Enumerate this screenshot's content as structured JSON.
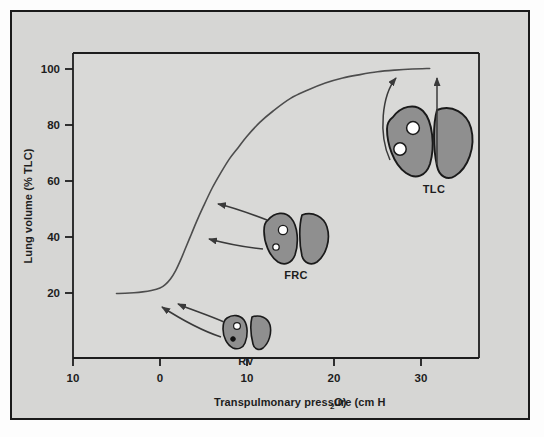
{
  "figure": {
    "background_color": "#d6d6d4",
    "plot_background_color": "#d9d9d7",
    "frame_color": "#1a1a1a",
    "curve_color": "#4d4d4d",
    "lung_fill_color": "#8f8f8f",
    "lung_outline_color": "#1a1a1a",
    "alveolus_fill_color": "#ffffff"
  },
  "chart_data": {
    "type": "line",
    "title": "",
    "subtitle": "",
    "xlabel": "Transpulmonary pressure (cm H",
    "xlabel_sub": "2",
    "xlabel_tail": "O)",
    "xlabel_full": "Transpulmonary pressure (cm H2O)",
    "ylabel": "Lung volume (% TLC)",
    "xlim": [
      -13.5,
      36
    ],
    "ylim": [
      6,
      107
    ],
    "grid": false,
    "legend": "none",
    "x_ticks": [
      {
        "value": -10,
        "label": "10"
      },
      {
        "value": 0,
        "label": "0"
      },
      {
        "value": 10,
        "label": "10"
      },
      {
        "value": 20,
        "label": "20"
      },
      {
        "value": 30,
        "label": "30"
      }
    ],
    "y_ticks": [
      {
        "value": 20,
        "label": "20"
      },
      {
        "value": 40,
        "label": "40"
      },
      {
        "value": 60,
        "label": "60"
      },
      {
        "value": 80,
        "label": "80"
      },
      {
        "value": 100,
        "label": "100"
      }
    ],
    "series": [
      {
        "name": "Static pressure-volume curve of the lung",
        "x": [
          -5.0,
          -4.0,
          -3.0,
          -2.0,
          -1.0,
          0.0,
          0.6,
          1.2,
          1.8,
          2.4,
          3.0,
          3.6,
          4.2,
          5.0,
          6.0,
          7.0,
          8.0,
          9.0,
          10.0,
          11.5,
          13.0,
          15.0,
          17.0,
          19.0,
          21.0,
          23.0,
          25.0,
          27.0,
          29.0,
          31.0
        ],
        "y": [
          19.8,
          19.9,
          20.1,
          20.4,
          20.9,
          21.8,
          23.0,
          25.0,
          28.0,
          32.0,
          36.5,
          41.0,
          45.5,
          51.0,
          57.5,
          63.0,
          68.0,
          72.0,
          76.0,
          81.0,
          85.0,
          89.5,
          92.5,
          95.0,
          96.8,
          98.0,
          99.0,
          99.6,
          100.0,
          100.2
        ]
      }
    ],
    "annotations": [
      {
        "id": "rv",
        "label": "RV",
        "volume_percent": 20,
        "description": "Residual volume lungs with one open alveolus and one collapsed alveolus"
      },
      {
        "id": "frc",
        "label": "FRC",
        "volume_percent": 40,
        "description": "Functional residual capacity lungs with two partially inflated alveoli"
      },
      {
        "id": "tlc",
        "label": "TLC",
        "volume_percent": 100,
        "description": "Total lung capacity lungs with two fully inflated alveoli"
      }
    ]
  },
  "axes": {
    "x_axis_label": "Transpulmonary pressure (cm H",
    "x_axis_label_subscript": "2",
    "x_axis_label_end": "O)",
    "y_axis_label": "Lung volume (% TLC)"
  },
  "tick_labels": {
    "x": [
      "10",
      "0",
      "10",
      "20",
      "30"
    ],
    "y": [
      "20",
      "40",
      "60",
      "80",
      "100"
    ]
  },
  "annotation_labels": {
    "rv": "RV",
    "frc": "FRC",
    "tlc": "TLC"
  }
}
